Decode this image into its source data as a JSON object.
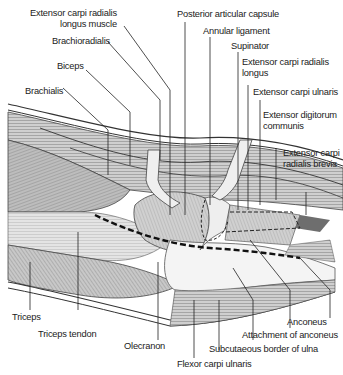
{
  "figure": {
    "labels": {
      "ecrl_muscle": [
        "Extensor carpi radialis",
        "longus muscle"
      ],
      "brachioradialis": "Brachioradialis",
      "biceps": "Biceps",
      "brachialis": "Brachialis",
      "posterior_capsule": "Posterior articular capsule",
      "annular_ligament": "Annular ligament",
      "supinator": "Supinator",
      "ecrl": [
        "Extensor carpi radialis",
        "longus"
      ],
      "ecu": "Extensor carpi ulnaris",
      "edc": [
        "Extensor digitorum",
        "communis"
      ],
      "ecrb": [
        "Extensor carpi",
        "radialis brevis"
      ],
      "triceps": "Triceps",
      "triceps_tendon": "Triceps tendon",
      "olecranon": "Olecranon",
      "anconeus": "Anconeus",
      "attachment_anconeus": "Attachment of anconeus",
      "subcutaneous_border": "Subcutaeous border of ulna",
      "fcu": "Flexor carpi ulnaris"
    },
    "colors": {
      "line": "#222222",
      "muscle_dark": "#8a8a8a",
      "muscle_mid": "#b5b5b5",
      "muscle_light": "#dcdcdc",
      "bone": "#f2f2f2"
    }
  }
}
